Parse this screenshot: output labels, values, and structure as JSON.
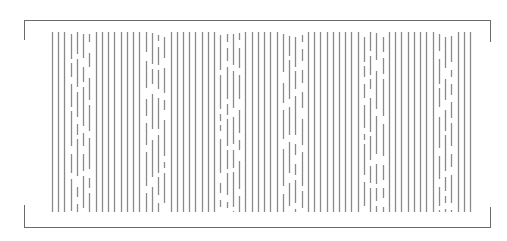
{
  "figure": {
    "line_color": "#8a8a8a",
    "frame_color": "#6a6a6a",
    "background": "#ffffff",
    "line_count": 68,
    "line_x_start": 52,
    "line_x_end": 470,
    "line_y_top": 32,
    "line_y_bottom": 212,
    "broken_line_groups": [
      {
        "start_index": 3,
        "end_index": 6
      },
      {
        "start_index": 15,
        "end_index": 18
      },
      {
        "start_index": 27,
        "end_index": 30
      },
      {
        "start_index": 37,
        "end_index": 40
      },
      {
        "start_index": 50,
        "end_index": 53
      },
      {
        "start_index": 62,
        "end_index": 64
      }
    ]
  },
  "frame": {
    "top": 20,
    "bottom": 227,
    "left": 24,
    "right": 490,
    "bracket_length": 20
  }
}
